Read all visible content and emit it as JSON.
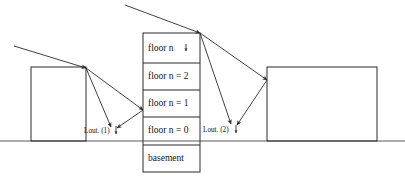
{
  "figure": {
    "background_color": "#ffffff",
    "line_color": "#2b2b2b",
    "ground_color": "#5a5a5a",
    "text_color": "#141414"
  },
  "ground": {
    "label": "ground-line",
    "y": 141
  },
  "buildings": [
    {
      "id": "left-building",
      "name": "left-building",
      "x": 31,
      "y": 67,
      "width": 55,
      "height": 74,
      "floors": []
    },
    {
      "id": "center-building",
      "name": "center-building",
      "x": 143,
      "y": 33,
      "width": 57,
      "height": 139,
      "floors": [
        {
          "id": "floor-n",
          "label": "floor n",
          "y_top": 33,
          "y_bottom": 63,
          "has_arrow_marker": true
        },
        {
          "id": "floor-n-2",
          "label": "floor n = 2",
          "y_top": 63,
          "y_bottom": 90,
          "has_arrow_marker": false
        },
        {
          "id": "floor-n-1",
          "label": "floor n = 1",
          "y_top": 90,
          "y_bottom": 117,
          "has_arrow_marker": false
        },
        {
          "id": "floor-n-0",
          "label": "floor n = 0",
          "y_top": 117,
          "y_bottom": 145,
          "has_arrow_marker": false
        },
        {
          "id": "floor-basement",
          "label": "basement",
          "y_top": 145,
          "y_bottom": 172,
          "has_arrow_marker": false
        }
      ]
    },
    {
      "id": "right-building",
      "name": "right-building",
      "x": 267,
      "y": 67,
      "width": 110,
      "height": 74,
      "floors": []
    }
  ],
  "annotations": [
    {
      "id": "lout-1",
      "label": "Lout. (1)",
      "x": 84,
      "y": 130,
      "has_arrow_marker": true
    },
    {
      "id": "lout-2",
      "label": "Lout. (2)",
      "x": 203,
      "y": 129,
      "has_arrow_marker": true
    }
  ],
  "rays": [
    {
      "id": "incident-ray-1",
      "name": "incident-ray-left",
      "from": [
        14,
        46
      ],
      "to": [
        86,
        68
      ],
      "arrowhead": true
    },
    {
      "id": "reflected-ray-1a",
      "name": "reflected-ray-left-to-lout1",
      "from": [
        86,
        68
      ],
      "to": [
        111,
        127
      ],
      "arrowhead": true
    },
    {
      "id": "reflected-ray-1b",
      "name": "reflected-ray-left-to-center",
      "from": [
        86,
        68
      ],
      "to": [
        143,
        110
      ],
      "arrowhead": true
    },
    {
      "id": "reflected-ray-1c",
      "name": "reflected-ray-center-to-lout1",
      "from": [
        143,
        110
      ],
      "to": [
        117,
        128
      ],
      "arrowhead": true
    },
    {
      "id": "incident-ray-2",
      "name": "incident-ray-center",
      "from": [
        125,
        5
      ],
      "to": [
        200,
        33
      ],
      "arrowhead": true
    },
    {
      "id": "reflected-ray-2a",
      "name": "reflected-ray-center-to-lout2",
      "from": [
        200,
        33
      ],
      "to": [
        231,
        124
      ],
      "arrowhead": true
    },
    {
      "id": "reflected-ray-2b",
      "name": "reflected-ray-center-to-right",
      "from": [
        200,
        33
      ],
      "to": [
        267,
        80
      ],
      "arrowhead": true
    },
    {
      "id": "reflected-ray-2c",
      "name": "reflected-ray-right-to-lout2",
      "from": [
        267,
        80
      ],
      "to": [
        237,
        125
      ],
      "arrowhead": true
    }
  ]
}
